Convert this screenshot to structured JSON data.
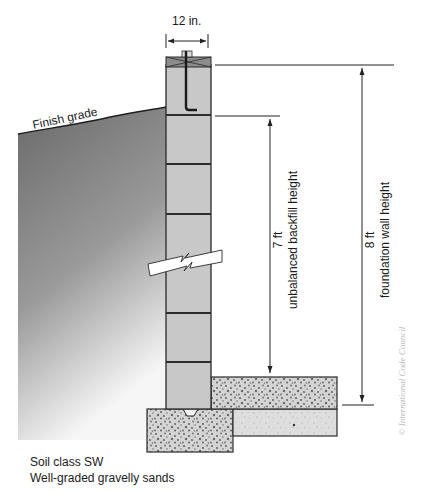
{
  "diagram": {
    "labels": {
      "wall_width": "12 in.",
      "finish_grade": "Finish grade",
      "backfill_value": "7 ft",
      "backfill_caption": "unbalanced backfill height",
      "wall_height_value": "8 ft",
      "wall_height_caption": "foundation wall height",
      "soil_class": "Soil class SW",
      "soil_description": "Well-graded gravelly sands",
      "credit": "© International Code Council"
    },
    "colors": {
      "soil_dark": "#6f6f6f",
      "soil_light": "#f4f4f4",
      "block": "#c9c9c9",
      "joint": "#3a3a3a",
      "concrete": "#d2d2d2",
      "slab_base": "#e0e0e0",
      "line": "#222222"
    }
  }
}
